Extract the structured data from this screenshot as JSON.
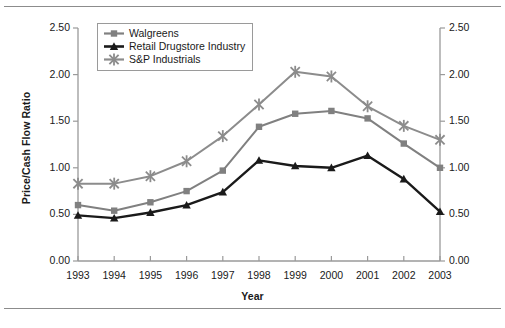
{
  "figure": {
    "rules": {
      "top": "horizontal-rule",
      "bottom": "horizontal-rule"
    }
  },
  "chart_data": {
    "type": "line",
    "title": "",
    "xlabel": "Year",
    "ylabel": "Price/Cash Flow Ratio",
    "categories": [
      "1993",
      "1994",
      "1995",
      "1996",
      "1997",
      "1998",
      "1999",
      "2000",
      "2001",
      "2002",
      "2003"
    ],
    "x": [
      1993,
      1994,
      1995,
      1996,
      1997,
      1998,
      1999,
      2000,
      2001,
      2002,
      2003
    ],
    "ylim": [
      0.0,
      2.5
    ],
    "yticks": [
      "0.00",
      "0.50",
      "1.00",
      "1.50",
      "2.00",
      "2.50"
    ],
    "ytick_values": [
      0.0,
      0.5,
      1.0,
      1.5,
      2.0,
      2.5
    ],
    "grid": false,
    "legend_position": "upper-left-inside",
    "dual_y_axis": true,
    "series": [
      {
        "name": "Walgreens",
        "marker": "square",
        "color": "#808080",
        "values": [
          0.6,
          0.54,
          0.63,
          0.75,
          0.97,
          1.44,
          1.58,
          1.61,
          1.53,
          1.26,
          1.0
        ]
      },
      {
        "name": "Retail Drugstore Industry",
        "marker": "triangle",
        "color": "#1a1a1a",
        "values": [
          0.49,
          0.46,
          0.52,
          0.6,
          0.74,
          1.08,
          1.02,
          1.0,
          1.13,
          0.88,
          0.53
        ]
      },
      {
        "name": "S&P Industrials",
        "marker": "cross",
        "color": "#8c8c8c",
        "values": [
          0.83,
          0.83,
          0.91,
          1.07,
          1.34,
          1.68,
          2.03,
          1.98,
          1.66,
          1.45,
          1.3
        ]
      }
    ]
  }
}
